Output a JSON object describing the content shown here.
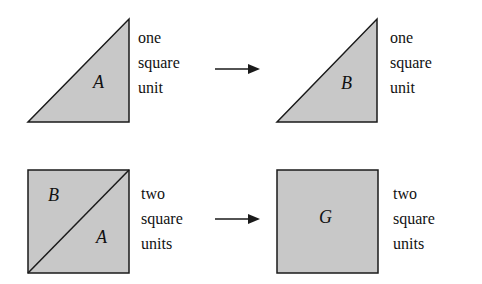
{
  "colors": {
    "fill": "#c8c8c8",
    "stroke": "#1a1a1a"
  },
  "rows": [
    {
      "left_shape": {
        "type": "triangle",
        "labels": [
          "A"
        ]
      },
      "left_caption": [
        "one",
        "square",
        "unit"
      ],
      "right_shape": {
        "type": "triangle",
        "labels": [
          "B"
        ]
      },
      "right_caption": [
        "one",
        "square",
        "unit"
      ]
    },
    {
      "left_shape": {
        "type": "square-split",
        "labels": [
          "B",
          "A"
        ]
      },
      "left_caption": [
        "two",
        "square",
        "units"
      ],
      "right_shape": {
        "type": "square",
        "labels": [
          "G"
        ]
      },
      "right_caption": [
        "two",
        "square",
        "units"
      ]
    }
  ]
}
